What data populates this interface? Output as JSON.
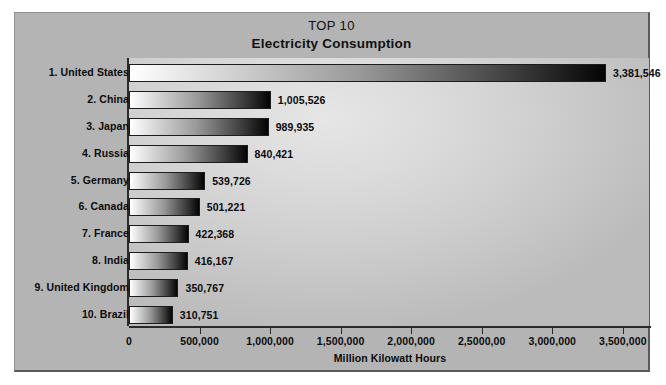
{
  "chart_data": {
    "type": "bar",
    "orientation": "horizontal",
    "title": "TOP 10",
    "subtitle": "Electricity Consumption",
    "xlabel": "Million Kilowatt Hours",
    "ylabel": "",
    "xlim": [
      0,
      3700000
    ],
    "grid": false,
    "legend": false,
    "tick_labels": [
      "0",
      "500,000",
      "1,000,000",
      "1,500,000",
      "2,000,000",
      "2,5000,00",
      "3,000,000",
      "3,500,000"
    ],
    "tick_values": [
      0,
      500000,
      1000000,
      1500000,
      2000000,
      2500000,
      3000000,
      3500000
    ],
    "categories": [
      "1. United States",
      "2. China",
      "3. Japan",
      "4. Russia",
      "5. Germany",
      "6. Canada",
      "7. France",
      "8. India",
      "9. United Kingdom",
      "10. Brazil"
    ],
    "values": [
      3381546,
      1005526,
      989935,
      840421,
      539726,
      501221,
      422368,
      416167,
      350767,
      310751
    ],
    "value_labels": [
      "3,381,546",
      "1,005,526",
      "989,935",
      "840,421",
      "539,726",
      "501,221",
      "422,368",
      "416,167",
      "350,767",
      "310,751"
    ]
  },
  "colors": {
    "frame_background": "#b4b4b4",
    "plot_background": "#dcdcdc",
    "bar_gradient_start": "#ffffff",
    "bar_gradient_end": "#040404",
    "text": "#0b0b0b",
    "axis": "#2a2a2a"
  }
}
